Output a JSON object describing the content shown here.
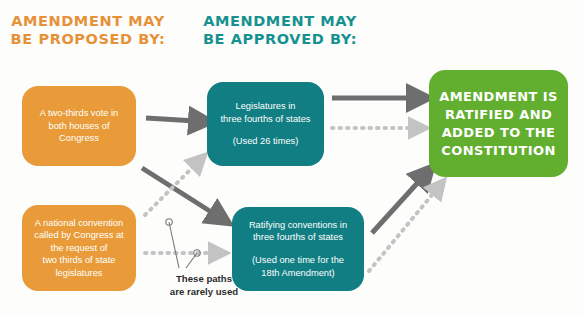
{
  "headings": {
    "proposed": "AMENDMENT MAY BE PROPOSED BY:",
    "approved": "AMENDMENT MAY BE APPROVED BY:"
  },
  "colors": {
    "orange": "#E89B38",
    "teal": "#107E82",
    "green": "#62AE2E",
    "arrow_solid": "#6E6E6E",
    "arrow_faded": "#C3C3C3",
    "heading_orange": "#E69138",
    "heading_teal": "#15918F",
    "annotation_text": "#2b2b2b",
    "box_text": "#FFFFFF"
  },
  "boxes": {
    "congress_vote": {
      "lines": [
        "A two-thirds vote in",
        "both houses of",
        "Congress"
      ]
    },
    "national_convention": {
      "lines": [
        "A national convention",
        "called by Congress at",
        "the request of",
        "two thirds of state",
        "legislatures"
      ]
    },
    "legislatures": {
      "lines": [
        "Legislatures in",
        "three fourths of states"
      ],
      "note": "(Used 26 times)"
    },
    "ratifying_conventions": {
      "lines": [
        "Ratifying conventions in",
        "three fourths of states"
      ],
      "note_lines": [
        "(Used one time for the",
        "18th Amendment)"
      ]
    },
    "ratified": {
      "lines": [
        "AMENDMENT IS",
        "RATIFIED AND",
        "ADDED TO THE",
        "CONSTITUTION"
      ]
    }
  },
  "annotation": {
    "rarely_used_line1": "These paths",
    "rarely_used_line2": "are rarely used"
  }
}
